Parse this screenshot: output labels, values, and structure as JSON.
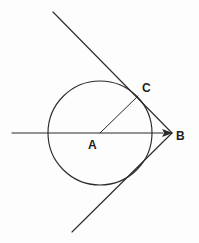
{
  "figure": {
    "background_color": "#fdfdfd",
    "stroke_color": "#2b2b2b",
    "width": 199,
    "height": 243
  },
  "labels": {
    "center": "A",
    "external_point": "B",
    "tangent_point": "C"
  },
  "chart_data": {
    "type": "diagram",
    "xlabel": "",
    "ylabel": "",
    "xlim": [
      0,
      199
    ],
    "ylim": [
      243,
      0
    ],
    "grid": false,
    "legend": "none",
    "points": [
      {
        "name": "A",
        "role": "circle-center",
        "x": 100,
        "y": 133,
        "label": "A",
        "label_x": 93,
        "label_y": 146
      },
      {
        "name": "B",
        "role": "external-point",
        "x": 172,
        "y": 133,
        "label": "B",
        "label_x": 181,
        "label_y": 137
      },
      {
        "name": "C",
        "role": "upper-tangent-point",
        "x": 138,
        "y": 96,
        "label": "C",
        "label_x": 147,
        "label_y": 89
      },
      {
        "name": "D",
        "role": "lower-tangent-point",
        "x": 138,
        "y": 170,
        "label": "",
        "label_x": 0,
        "label_y": 0
      }
    ],
    "circle": {
      "cx": 100,
      "cy": 133,
      "r": 52
    },
    "segments": [
      {
        "name": "axis-ray-AB",
        "x1": 12,
        "y1": 133,
        "x2": 172,
        "y2": 133,
        "arrow_end": true
      },
      {
        "name": "radius-AC",
        "x1": 100,
        "y1": 133,
        "x2": 138,
        "y2": 96,
        "arrow_end": false
      },
      {
        "name": "upper-tangent",
        "x1": 53,
        "y1": 12,
        "x2": 172,
        "y2": 133,
        "arrow_end": false
      },
      {
        "name": "lower-tangent",
        "x1": 72,
        "y1": 232,
        "x2": 172,
        "y2": 133,
        "arrow_end": false
      }
    ],
    "arrowheads": [
      {
        "name": "arrowhead-at-B",
        "tip_x": 173,
        "tip_y": 133,
        "angle_deg": 0,
        "length": 11,
        "half_width": 4
      }
    ]
  }
}
